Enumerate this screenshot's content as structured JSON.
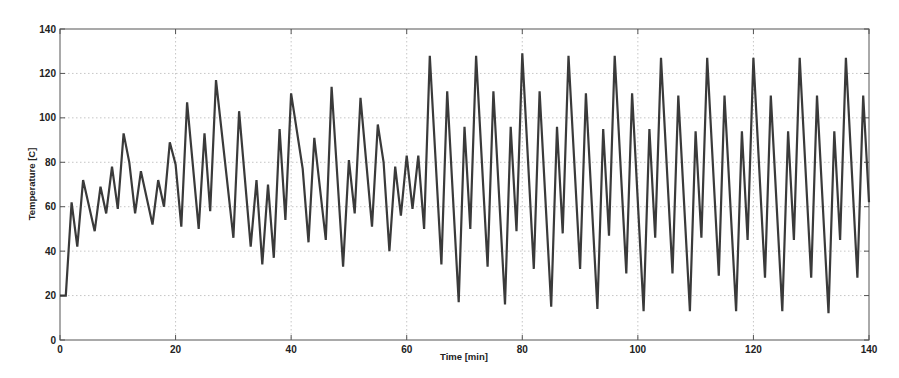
{
  "chart_data": {
    "type": "line",
    "title": "",
    "xlabel": "Time [min]",
    "ylabel": "Temperature [C]",
    "xlim": [
      0,
      140
    ],
    "ylim": [
      0,
      140
    ],
    "xticks": [
      0,
      20,
      40,
      60,
      80,
      100,
      120,
      140
    ],
    "yticks": [
      0,
      20,
      40,
      60,
      80,
      100,
      120,
      140
    ],
    "grid": true,
    "legend": null,
    "line_color": "#3a3a3a",
    "series": [
      {
        "name": "Temperature",
        "x": [
          0,
          1,
          2,
          3,
          4,
          6,
          7,
          8,
          9,
          10,
          11,
          12,
          13,
          14,
          16,
          17,
          18,
          19,
          20,
          21,
          22,
          24,
          25,
          26,
          27,
          30,
          31,
          33,
          34,
          35,
          36,
          37,
          38,
          39,
          40,
          42,
          43,
          44,
          46,
          47,
          49,
          50,
          51,
          52,
          54,
          55,
          56,
          57,
          58,
          59,
          60,
          61,
          62,
          63,
          64,
          66,
          67,
          69,
          70,
          71,
          72,
          74,
          75,
          77,
          78,
          79,
          80,
          82,
          83,
          85,
          86,
          87,
          88,
          90,
          91,
          93,
          94,
          95,
          96,
          98,
          99,
          101,
          102,
          103,
          104,
          106,
          107,
          109,
          110,
          111,
          112,
          114,
          115,
          117,
          118,
          119,
          120,
          122,
          123,
          125,
          126,
          127,
          128,
          130,
          131,
          133,
          134,
          135,
          136,
          138,
          139,
          140
        ],
        "y": [
          20,
          20,
          62,
          42,
          72,
          49,
          69,
          57,
          78,
          59,
          93,
          80,
          57,
          76,
          52,
          72,
          60,
          89,
          79,
          51,
          107,
          50,
          93,
          58,
          117,
          46,
          103,
          42,
          72,
          34,
          70,
          37,
          95,
          54,
          111,
          77,
          44,
          91,
          45,
          114,
          33,
          81,
          57,
          109,
          51,
          97,
          80,
          40,
          78,
          56,
          83,
          59,
          83,
          50,
          128,
          34,
          112,
          17,
          96,
          50,
          128,
          33,
          112,
          16,
          96,
          49,
          129,
          32,
          112,
          15,
          96,
          48,
          128,
          32,
          111,
          14,
          95,
          47,
          128,
          30,
          111,
          13,
          95,
          46,
          127,
          30,
          110,
          13,
          94,
          46,
          127,
          29,
          110,
          13,
          94,
          45,
          127,
          28,
          110,
          13,
          94,
          45,
          127,
          28,
          110,
          12,
          94,
          45,
          127,
          28,
          110,
          62
        ]
      }
    ]
  },
  "axes": {
    "xlabel": "Time [min]",
    "ylabel": "Temperature [C]",
    "xtick_labels": [
      "0",
      "20",
      "40",
      "60",
      "80",
      "100",
      "120",
      "140"
    ],
    "ytick_labels": [
      "0",
      "20",
      "40",
      "60",
      "80",
      "100",
      "120",
      "140"
    ]
  }
}
